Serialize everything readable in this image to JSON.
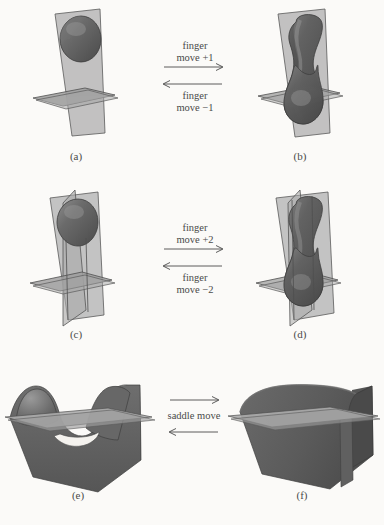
{
  "figure": {
    "background_color": "#fbfaf8",
    "surface_color": "#5d5d5d",
    "surface_highlight_color": "#8f8f8f",
    "plane_fill_color": "#b3b3b3",
    "plane_edge_color": "#585858",
    "text_color": "#4a4a4a"
  },
  "panels": [
    {
      "id": "a",
      "caption": "(a)",
      "description": "vertical plane with horizontal plane and single teardrop blob above"
    },
    {
      "id": "b",
      "caption": "(b)",
      "description": "vertical plane with horizontal plane and elongated hourglass-neck surface"
    },
    {
      "id": "c",
      "caption": "(c)",
      "description": "two crossing vertical planes with horizontal plane and teardrop blob"
    },
    {
      "id": "d",
      "caption": "(d)",
      "description": "two crossing vertical planes with horizontal plane and hourglass-neck surface"
    },
    {
      "id": "e",
      "caption": "(e)",
      "description": "saddle surface with two humps and a hole, cut by horizontal plane"
    },
    {
      "id": "f",
      "caption": "(f)",
      "description": "smooth arch tunnel surface cut by horizontal plane"
    }
  ],
  "arrows": [
    {
      "id": "row1",
      "forward_label_line1": "finger",
      "forward_label_line2": "move +1",
      "backward_label_line1": "finger",
      "backward_label_line2": "move −1",
      "forward_direction": "right",
      "backward_direction": "left"
    },
    {
      "id": "row2",
      "forward_label_line1": "finger",
      "forward_label_line2": "move +2",
      "backward_label_line1": "finger",
      "backward_label_line2": "move −2",
      "forward_direction": "right",
      "backward_direction": "left"
    },
    {
      "id": "row3",
      "center_label": "saddle move",
      "forward_direction": "right",
      "backward_direction": "left"
    }
  ]
}
